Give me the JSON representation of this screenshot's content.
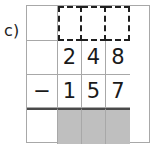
{
  "exercise": {
    "part_label": "c)",
    "type": "column-subtraction",
    "operator": "−",
    "columns": 4,
    "rows": 4,
    "grid": {
      "row_answer": {
        "role": "answer-row",
        "style": "dashed",
        "cells": [
          "",
          "",
          "",
          ""
        ]
      },
      "row_minuend": {
        "role": "minuend-row",
        "cells": [
          "",
          "2",
          "4",
          "8"
        ]
      },
      "row_subtrahend": {
        "role": "subtrahend-row",
        "cells": [
          "−",
          "1",
          "5",
          "7"
        ]
      },
      "row_result": {
        "role": "result-row",
        "cells": [
          "",
          "",
          "",
          ""
        ],
        "shaded": [
          false,
          true,
          true,
          true
        ]
      }
    },
    "minuend": "248",
    "subtrahend": "157",
    "numbers": {
      "minuend_digits": [
        "2",
        "4",
        "8"
      ],
      "subtrahend_digits": [
        "1",
        "5",
        "7"
      ]
    }
  },
  "colors": {
    "grid_line": "#a8a8a8",
    "dashed_line": "#1f1f1f",
    "result_rule": "#4a4a4a",
    "shading": "#bfbfbf",
    "text": "#1a1a1a",
    "background": "#ffffff"
  }
}
